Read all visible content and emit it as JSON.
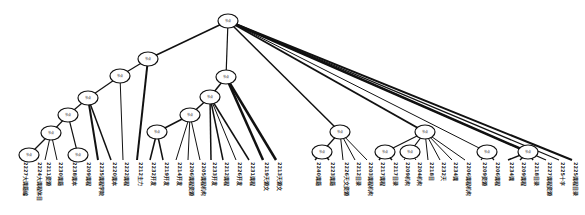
{
  "diagram": {
    "type": "tree",
    "node_label": "节点",
    "nodes": [
      {
        "id": "root",
        "x": 228,
        "y": 21
      },
      {
        "id": "n1",
        "x": 148,
        "y": 59
      },
      {
        "id": "n2",
        "x": 120,
        "y": 76
      },
      {
        "id": "n3",
        "x": 88,
        "y": 98
      },
      {
        "id": "n4",
        "x": 68,
        "y": 115
      },
      {
        "id": "n5",
        "x": 51,
        "y": 133
      },
      {
        "id": "n6",
        "x": 29,
        "y": 155
      },
      {
        "id": "n7",
        "x": 78,
        "y": 155
      },
      {
        "id": "n8",
        "x": 226,
        "y": 77
      },
      {
        "id": "n9",
        "x": 210,
        "y": 97
      },
      {
        "id": "n10",
        "x": 190,
        "y": 115
      },
      {
        "id": "n11",
        "x": 157,
        "y": 132
      },
      {
        "id": "n12",
        "x": 340,
        "y": 132
      },
      {
        "id": "n13",
        "x": 322,
        "y": 152
      },
      {
        "id": "n14",
        "x": 425,
        "y": 132
      },
      {
        "id": "n15",
        "x": 385,
        "y": 152
      },
      {
        "id": "n16",
        "x": 410,
        "y": 152
      },
      {
        "id": "n17",
        "x": 487,
        "y": 152
      },
      {
        "id": "n18",
        "x": 528,
        "y": 152
      }
    ],
    "edges": [
      [
        "root",
        "n1",
        1.5
      ],
      [
        "n1",
        "n2",
        1.2
      ],
      [
        "n2",
        "n3",
        1.2
      ],
      [
        "n3",
        "n4",
        1.2
      ],
      [
        "n4",
        "n5",
        1.2
      ],
      [
        "n5",
        "n6",
        1.2
      ],
      [
        "n4",
        "n7",
        1.2
      ],
      [
        "root",
        "n8",
        1.2
      ],
      [
        "n8",
        "n9",
        1.5
      ],
      [
        "n9",
        "n10",
        1.5
      ],
      [
        "n10",
        "n11",
        1.5
      ],
      [
        "root",
        "n12",
        1.5
      ],
      [
        "n12",
        "n13",
        1.2
      ],
      [
        "root",
        "n14",
        2
      ],
      [
        "n14",
        "n15",
        1.2
      ],
      [
        "n14",
        "n16",
        1.2
      ],
      [
        "root",
        "n17",
        1
      ],
      [
        "root",
        "n18",
        2.5
      ]
    ],
    "leaves": [
      {
        "parent": "n6",
        "x": 22,
        "label": "2227大课籍编",
        "w": 1.5
      },
      {
        "parent": "n6",
        "x": 36,
        "label": "2224大课程体目",
        "w": 1.5
      },
      {
        "parent": "n5",
        "x": 45,
        "label": "2211资源",
        "w": 1
      },
      {
        "parent": "n5",
        "x": 57,
        "label": "2230课籍",
        "w": 1
      },
      {
        "parent": "n7",
        "x": 71,
        "label": "2238课本",
        "w": 1.5
      },
      {
        "parent": "n7",
        "x": 85,
        "label": "2209课程",
        "w": 1.5
      },
      {
        "parent": "n3",
        "x": 98,
        "label": "2235课程学院",
        "w": 2
      },
      {
        "parent": "n3",
        "x": 111,
        "label": "2220课本",
        "w": 1.5
      },
      {
        "parent": "n2",
        "x": 123,
        "label": "2222课程",
        "w": 1
      },
      {
        "parent": "n1",
        "x": 137,
        "label": "2212主力",
        "w": 2
      },
      {
        "parent": "n11",
        "x": 150,
        "label": "2232开发",
        "w": 1.5
      },
      {
        "parent": "n11",
        "x": 163,
        "label": "2219开发",
        "w": 1.5
      },
      {
        "parent": "n10",
        "x": 176,
        "label": "2214开发",
        "w": 1
      },
      {
        "parent": "n10",
        "x": 188,
        "label": "2206课程资源",
        "w": 1
      },
      {
        "parent": "n10",
        "x": 200,
        "label": "2205课程机构",
        "w": 1
      },
      {
        "parent": "n9",
        "x": 211,
        "label": "2233开发",
        "w": 1.5
      },
      {
        "parent": "n9",
        "x": 223,
        "label": "2212课程",
        "w": 1.5
      },
      {
        "parent": "n9",
        "x": 236,
        "label": "2226开发",
        "w": 1
      },
      {
        "parent": "n9",
        "x": 249,
        "label": "2231课程",
        "w": 1.5
      },
      {
        "parent": "n8",
        "x": 263,
        "label": "2219天源文",
        "w": 2.5
      },
      {
        "parent": "n8",
        "x": 276,
        "label": "2213天源文",
        "w": 2.5
      },
      {
        "parent": "n13",
        "x": 315,
        "label": "2240课籍",
        "w": 1.5
      },
      {
        "parent": "n13",
        "x": 329,
        "label": "2223课籍",
        "w": 1.5
      },
      {
        "parent": "n12",
        "x": 343,
        "label": "2226天文资源",
        "w": 1
      },
      {
        "parent": "n12",
        "x": 355,
        "label": "2212目录",
        "w": 1
      },
      {
        "parent": "n12",
        "x": 367,
        "label": "2203课程机构",
        "w": 1
      },
      {
        "parent": "n15",
        "x": 379,
        "label": "2217课程",
        "w": 1.5
      },
      {
        "parent": "n15",
        "x": 392,
        "label": "2217目录",
        "w": 1.5
      },
      {
        "parent": "n16",
        "x": 404,
        "label": "2209机构",
        "w": 1
      },
      {
        "parent": "n16",
        "x": 416,
        "label": "2204机构",
        "w": 1
      },
      {
        "parent": "n14",
        "x": 428,
        "label": "2218目",
        "w": 1
      },
      {
        "parent": "n14",
        "x": 440,
        "label": "2232天",
        "w": 1
      },
      {
        "parent": "n14",
        "x": 452,
        "label": "2234课",
        "w": 1
      },
      {
        "parent": "n14",
        "x": 465,
        "label": "2206课程机构",
        "w": 1
      },
      {
        "parent": "n17",
        "x": 481,
        "label": "2209资源",
        "w": 1.2
      },
      {
        "parent": "n17",
        "x": 494,
        "label": "2206课程",
        "w": 1.2
      },
      {
        "parent": "n18",
        "x": 508,
        "label": "2234课",
        "w": 1.5
      },
      {
        "parent": "n18",
        "x": 520,
        "label": "2209课程",
        "w": 1.5
      },
      {
        "parent": "n18",
        "x": 533,
        "label": "2218目录",
        "w": 1.5
      },
      {
        "parent": "root",
        "x": 546,
        "label": "2227课程资源",
        "w": 1.2
      },
      {
        "parent": "root",
        "x": 559,
        "label": "2225十字",
        "w": 1.2
      },
      {
        "parent": "root",
        "x": 572,
        "label": "2225课程目录",
        "w": 2
      }
    ]
  }
}
